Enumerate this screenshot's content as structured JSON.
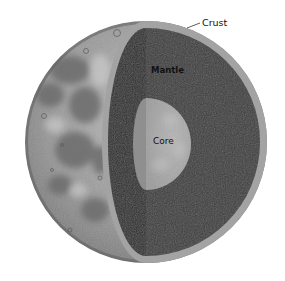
{
  "diagram": {
    "labels": {
      "crust": "Crust",
      "mantle": "Mantle",
      "core": "Core"
    },
    "colors": {
      "background": "#ffffff",
      "surface": "#8e8e8e",
      "surface_light": "#b8b8b8",
      "maria": "#6f6f6f",
      "crust": "#a3a3a3",
      "mantle_front": "#3c3c3c",
      "mantle_side": "#2d2d2d",
      "core_front": "#ababab",
      "core_side": "#8f8f8f",
      "leader_line": "#333333"
    }
  }
}
